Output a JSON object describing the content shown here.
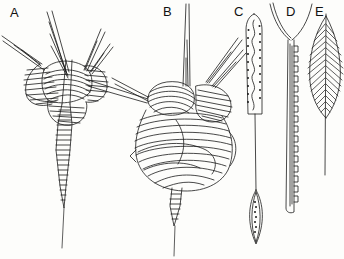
{
  "figure": {
    "type": "scientific-line-illustration",
    "background_color": "#fdfdfb",
    "ink_color": "#1a1a1a",
    "width": 344,
    "height": 259,
    "panel_count": 5
  },
  "labels": [
    {
      "id": "A",
      "text": "A",
      "x": 10,
      "y": 6
    },
    {
      "id": "B",
      "text": "B",
      "x": 163,
      "y": 5
    },
    {
      "id": "C",
      "text": "C",
      "x": 234,
      "y": 5
    },
    {
      "id": "D",
      "text": "D",
      "x": 286,
      "y": 5
    },
    {
      "id": "E",
      "text": "E",
      "x": 315,
      "y": 5
    }
  ],
  "specimens": [
    {
      "id": "A",
      "label": "A",
      "description": "Conical test with flaring hatched collar lobes, several long radiating apical and lateral spines, and a banded tapering caudal tube ending in a fine point.",
      "features": [
        "radiating-spines",
        "hatched-collar",
        "banded-caudal-tube",
        "fine-terminal-point"
      ],
      "spine_count": 5
    },
    {
      "id": "B",
      "label": "B",
      "description": "Larger test with broad overlapping hatched lobes, one tall tapering dorsal spine, two shorter lateral spines, and a short banded caudal tube with terminal bristle.",
      "features": [
        "dorsal-spine",
        "lateral-spines",
        "overlapping-hatched-lobes",
        "banded-caudal-tube"
      ],
      "spine_count": 4
    },
    {
      "id": "C",
      "label": "C",
      "description": "Elongate club-shaped blade with rounded tip, dotted margins and a sinuous median line; below it a detached lens-shaped spindle with beaded interior.",
      "features": [
        "club-blade",
        "dotted-margin",
        "sinuous-median-line",
        "lens-spindle"
      ]
    },
    {
      "id": "D",
      "label": "D",
      "description": "Long straight shaft bearing square-toothed serrations along one margin, terminating above in a wide open V-shaped fork.",
      "features": [
        "v-fork",
        "serrated-margin",
        "long-shaft"
      ]
    },
    {
      "id": "E",
      "label": "E",
      "description": "Plumose element: a feather-like blade of fine oblique barbs arranged along a straight central rachis that continues as a bare shaft.",
      "features": [
        "plumose-blade",
        "central-rachis",
        "bare-shaft"
      ]
    }
  ]
}
